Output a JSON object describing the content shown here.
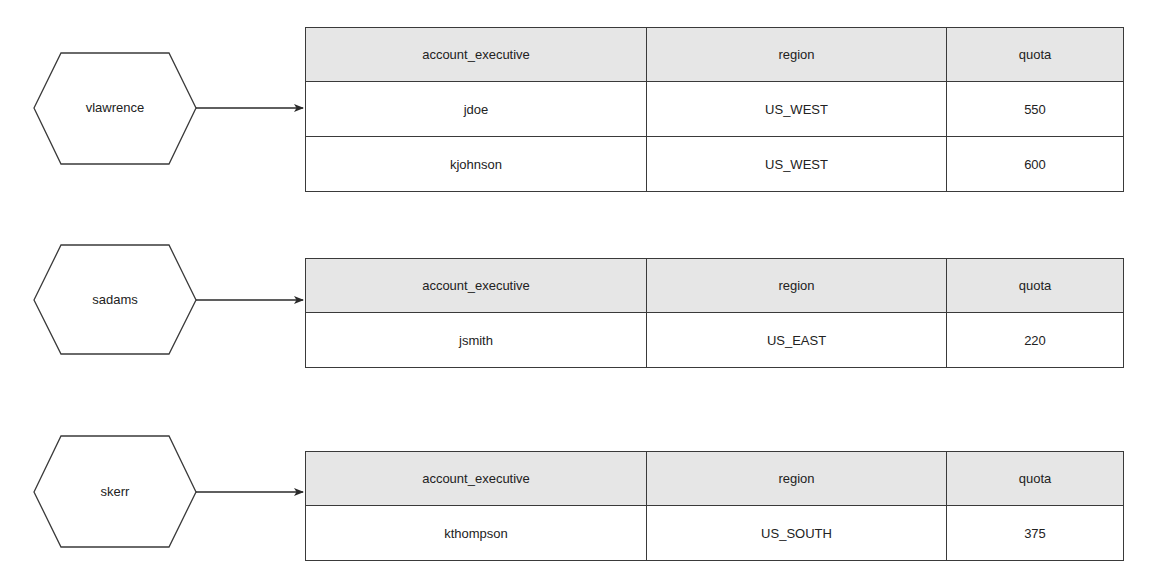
{
  "diagram": {
    "columns": [
      "account_executive",
      "region",
      "quota"
    ],
    "groups": [
      {
        "manager": "vlawrence",
        "rows": [
          {
            "account_executive": "jdoe",
            "region": "US_WEST",
            "quota": "550"
          },
          {
            "account_executive": "kjohnson",
            "region": "US_WEST",
            "quota": "600"
          }
        ]
      },
      {
        "manager": "sadams",
        "rows": [
          {
            "account_executive": "jsmith",
            "region": "US_EAST",
            "quota": "220"
          }
        ]
      },
      {
        "manager": "skerr",
        "rows": [
          {
            "account_executive": "kthompson",
            "region": "US_SOUTH",
            "quota": "375"
          }
        ]
      }
    ],
    "colors": {
      "stroke": "#3a3a3a",
      "header_fill": "#e6e6e6",
      "background": "#ffffff"
    }
  }
}
